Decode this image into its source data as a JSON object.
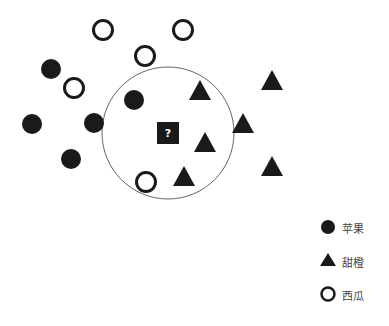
{
  "diagram": {
    "query_label": "?",
    "neighborhood_circle": {
      "cx": 168,
      "cy": 133,
      "r": 66
    },
    "query_point": {
      "x": 168,
      "y": 133
    },
    "points": [
      {
        "class": "apple",
        "x": 51,
        "y": 69
      },
      {
        "class": "apple",
        "x": 32,
        "y": 124
      },
      {
        "class": "apple",
        "x": 94,
        "y": 123
      },
      {
        "class": "apple",
        "x": 71,
        "y": 159
      },
      {
        "class": "apple",
        "x": 134,
        "y": 100
      },
      {
        "class": "orange",
        "x": 200,
        "y": 91
      },
      {
        "class": "orange",
        "x": 205,
        "y": 143
      },
      {
        "class": "orange",
        "x": 184,
        "y": 177
      },
      {
        "class": "orange",
        "x": 243,
        "y": 124
      },
      {
        "class": "orange",
        "x": 272,
        "y": 81
      },
      {
        "class": "orange",
        "x": 272,
        "y": 167
      },
      {
        "class": "watermelon",
        "x": 103,
        "y": 30
      },
      {
        "class": "watermelon",
        "x": 183,
        "y": 30
      },
      {
        "class": "watermelon",
        "x": 145,
        "y": 56
      },
      {
        "class": "watermelon",
        "x": 74,
        "y": 88
      },
      {
        "class": "watermelon",
        "x": 146,
        "y": 182
      }
    ]
  },
  "legend": {
    "items": [
      {
        "class": "apple",
        "label": "苹果",
        "icon": "filled-circle-icon"
      },
      {
        "class": "orange",
        "label": "甜橙",
        "icon": "filled-triangle-icon"
      },
      {
        "class": "watermelon",
        "label": "西瓜",
        "icon": "hollow-circle-icon"
      }
    ]
  },
  "colors": {
    "marker": "#1a1a1a",
    "circle_stroke": "#666666",
    "text": "#444444"
  }
}
